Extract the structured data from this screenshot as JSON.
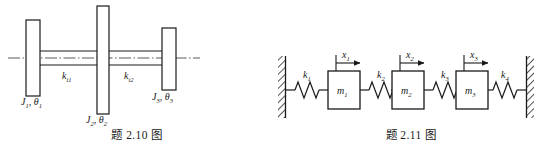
{
  "page": {
    "background_color": "#ffffff",
    "ink_color": "#1a1a1a",
    "width": 548,
    "height": 156
  },
  "figures": [
    {
      "id": "fig-2-10",
      "caption": "题 2.10 图",
      "type": "torsional-shaft-three-disc",
      "description": "Three rotating discs mounted on a horizontal shaft with two torsional spring segments",
      "centerline_style": "dash-dot",
      "discs": [
        {
          "name": "disc-1",
          "label_inertia": "J",
          "label_inertia_sub": "1",
          "label_angle": "θ",
          "label_angle_sub": "1",
          "label_text": "J₁, θ₁",
          "label_position": "below-left"
        },
        {
          "name": "disc-2",
          "label_inertia": "J",
          "label_inertia_sub": "2",
          "label_angle": "θ",
          "label_angle_sub": "2",
          "label_text": "J₂, θ₂",
          "label_position": "below-center"
        },
        {
          "name": "disc-3",
          "label_inertia": "J",
          "label_inertia_sub": "3",
          "label_angle": "θ",
          "label_angle_sub": "3",
          "label_text": "J₃, θ₃",
          "label_position": "below-right"
        }
      ],
      "shaft_segments": [
        {
          "name": "shaft-segment-1",
          "label_symbol": "k",
          "label_sub": "t1",
          "label_text": "kₜ₁"
        },
        {
          "name": "shaft-segment-2",
          "label_symbol": "k",
          "label_sub": "t2",
          "label_text": "kₜ₂"
        }
      ]
    },
    {
      "id": "fig-2-11",
      "caption": "题 2.11 图",
      "type": "mass-spring-chain",
      "description": "Three masses connected in series by four springs between two fixed hatched walls",
      "walls": [
        {
          "name": "wall-left",
          "hatching": "diagonal"
        },
        {
          "name": "wall-right",
          "hatching": "diagonal"
        }
      ],
      "springs": [
        {
          "name": "spring-k1",
          "label_symbol": "k",
          "label_sub": "1",
          "label_text": "k₁"
        },
        {
          "name": "spring-k2",
          "label_symbol": "k",
          "label_sub": "2",
          "label_text": "k₂"
        },
        {
          "name": "spring-k3",
          "label_symbol": "k",
          "label_sub": "3",
          "label_text": "k₃"
        },
        {
          "name": "spring-k4",
          "label_symbol": "k",
          "label_sub": "4",
          "label_text": "k₄"
        }
      ],
      "masses": [
        {
          "name": "mass-m1",
          "label_symbol": "m",
          "label_sub": "1",
          "label_text": "m₁"
        },
        {
          "name": "mass-m2",
          "label_symbol": "m",
          "label_sub": "2",
          "label_text": "m₂"
        },
        {
          "name": "mass-m3",
          "label_symbol": "m",
          "label_sub": "3",
          "label_text": "m₃"
        }
      ],
      "displacements": [
        {
          "name": "displacement-x1",
          "label_symbol": "x",
          "label_sub": "1",
          "label_text": "x₁",
          "arrow_direction": "right"
        },
        {
          "name": "displacement-x2",
          "label_symbol": "x",
          "label_sub": "2",
          "label_text": "x₂",
          "arrow_direction": "right"
        },
        {
          "name": "displacement-x3",
          "label_symbol": "x",
          "label_sub": "3",
          "label_text": "x₃",
          "arrow_direction": "right"
        }
      ]
    }
  ]
}
